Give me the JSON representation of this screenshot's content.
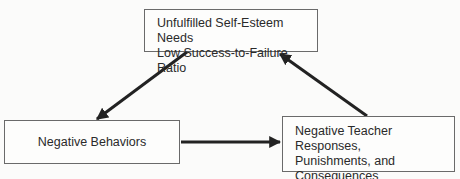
{
  "diagram": {
    "nodes": [
      {
        "id": "top",
        "lines": [
          "Unfulfilled Self-Esteem Needs",
          "Low Success-to-Failure Ratio"
        ]
      },
      {
        "id": "left",
        "lines": [
          "Negative Behaviors"
        ]
      },
      {
        "id": "right",
        "lines": [
          "Negative Teacher Responses,",
          "Punishments, and",
          "Consequences"
        ]
      }
    ],
    "edges": [
      {
        "from": "top",
        "to": "left"
      },
      {
        "from": "left",
        "to": "right"
      },
      {
        "from": "right",
        "to": "top"
      }
    ],
    "colors": {
      "line": "#222222",
      "border": "#6a6a6a",
      "background": "#fbfbfa"
    }
  }
}
